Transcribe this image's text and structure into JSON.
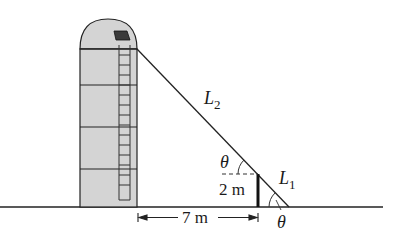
{
  "figure": {
    "labels": {
      "L2": "L",
      "L2_sub": "2",
      "L1": "L",
      "L1_sub": "1",
      "theta_top": "θ",
      "theta_bottom": "θ",
      "post_height": "2 m",
      "distance": "7 m"
    },
    "colors": {
      "silo_fill": "#d4d4d4",
      "line": "#222222",
      "window": "#3a3a3a",
      "background": "#ffffff"
    }
  }
}
